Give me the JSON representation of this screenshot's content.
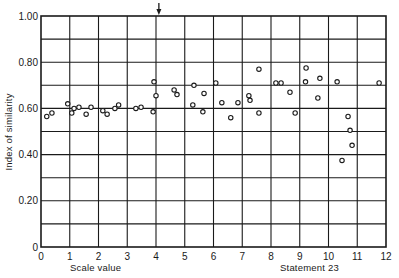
{
  "chart_data": {
    "type": "scatter",
    "title": "",
    "xlabel": "Scale value",
    "ylabel": "Index of similarity",
    "annotation": "Statement 23",
    "arrow_marker_x": 4.1,
    "xlim": [
      0,
      12
    ],
    "ylim": [
      0,
      1.0
    ],
    "xticks": [
      "0",
      "1",
      "2",
      "3",
      "4",
      "5",
      "6",
      "7",
      "8",
      "9",
      "10",
      "11",
      "12"
    ],
    "yticks": [
      "0",
      "0.20",
      "0.40",
      "0.60",
      "0.80",
      "1.00"
    ],
    "ytick_values": [
      0,
      0.2,
      0.4,
      0.6,
      0.8,
      1.0
    ],
    "grid": true,
    "grid_x_step": 1,
    "grid_y_step": 0.1,
    "marker": "open-circle",
    "colors": {
      "ink": "#1a1a1a",
      "background": "#ffffff"
    },
    "points": [
      {
        "x": 0.2,
        "y": 0.565
      },
      {
        "x": 0.38,
        "y": 0.58
      },
      {
        "x": 0.93,
        "y": 0.62
      },
      {
        "x": 1.07,
        "y": 0.58
      },
      {
        "x": 1.15,
        "y": 0.6
      },
      {
        "x": 1.32,
        "y": 0.605
      },
      {
        "x": 1.57,
        "y": 0.575
      },
      {
        "x": 1.74,
        "y": 0.605
      },
      {
        "x": 2.15,
        "y": 0.59
      },
      {
        "x": 2.3,
        "y": 0.575
      },
      {
        "x": 2.57,
        "y": 0.6
      },
      {
        "x": 2.7,
        "y": 0.615
      },
      {
        "x": 3.3,
        "y": 0.6
      },
      {
        "x": 3.48,
        "y": 0.605
      },
      {
        "x": 3.9,
        "y": 0.585
      },
      {
        "x": 3.93,
        "y": 0.715
      },
      {
        "x": 4.0,
        "y": 0.655
      },
      {
        "x": 4.63,
        "y": 0.68
      },
      {
        "x": 4.73,
        "y": 0.66
      },
      {
        "x": 5.28,
        "y": 0.615
      },
      {
        "x": 5.32,
        "y": 0.7
      },
      {
        "x": 5.63,
        "y": 0.585
      },
      {
        "x": 5.67,
        "y": 0.665
      },
      {
        "x": 6.08,
        "y": 0.71
      },
      {
        "x": 6.29,
        "y": 0.625
      },
      {
        "x": 6.6,
        "y": 0.56
      },
      {
        "x": 6.85,
        "y": 0.625
      },
      {
        "x": 7.23,
        "y": 0.655
      },
      {
        "x": 7.27,
        "y": 0.635
      },
      {
        "x": 7.58,
        "y": 0.77
      },
      {
        "x": 7.58,
        "y": 0.58
      },
      {
        "x": 8.17,
        "y": 0.71
      },
      {
        "x": 8.35,
        "y": 0.71
      },
      {
        "x": 8.66,
        "y": 0.67
      },
      {
        "x": 8.84,
        "y": 0.58
      },
      {
        "x": 9.2,
        "y": 0.715
      },
      {
        "x": 9.22,
        "y": 0.775
      },
      {
        "x": 9.63,
        "y": 0.645
      },
      {
        "x": 9.7,
        "y": 0.73
      },
      {
        "x": 10.3,
        "y": 0.715
      },
      {
        "x": 10.47,
        "y": 0.375
      },
      {
        "x": 10.68,
        "y": 0.565
      },
      {
        "x": 10.75,
        "y": 0.505
      },
      {
        "x": 10.82,
        "y": 0.44
      },
      {
        "x": 11.76,
        "y": 0.71
      }
    ]
  }
}
